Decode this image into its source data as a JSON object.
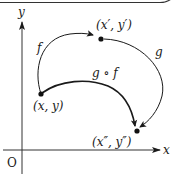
{
  "diagram": {
    "type": "function-composition",
    "axes": {
      "x_label": "x",
      "y_label": "y",
      "origin_label": "O"
    },
    "points": [
      {
        "id": "p1",
        "label": "(x, y)"
      },
      {
        "id": "p2",
        "label": "(x′, y′)"
      },
      {
        "id": "p3",
        "label": "(x″, y″)"
      }
    ],
    "arrows": [
      {
        "id": "f",
        "label": "f",
        "from": "p1",
        "to": "p2"
      },
      {
        "id": "g",
        "label": "g",
        "from": "p2",
        "to": "p3"
      },
      {
        "id": "gf",
        "label": "g ∘ f",
        "from": "p1",
        "to": "p3"
      }
    ],
    "colors": {
      "stroke": "#1a1a1a",
      "axis": "#333333",
      "background": "#ffffff"
    }
  }
}
